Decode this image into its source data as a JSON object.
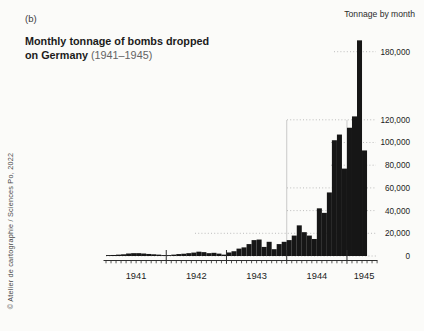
{
  "figure": {
    "panel_label": "(b)",
    "title_bold": "Monthly tonnage of bombs dropped",
    "title_line2_bold": "on Germany",
    "title_line2_regular": "(1941–1945)",
    "axis_title": "Tonnage by month",
    "credit": "© Atelier de cartographie / Sciences Po, 2022"
  },
  "colors": {
    "background": "#fbfbf9",
    "bar": "#161616",
    "axis": "#2e2e2e",
    "grid": "#b5b5b5",
    "separator_light": "#bdbdbd",
    "text": "#1c1c1c",
    "muted": "#636363"
  },
  "chart_data": {
    "type": "bar",
    "title": "Monthly tonnage of bombs dropped on Germany (1941–1945)",
    "xlabel": "",
    "ylabel": "Tonnage by month",
    "unit": "tons of bombs per month",
    "ylim": [
      0,
      190000
    ],
    "grid": "dotted horizontal",
    "legend_position": "none",
    "yticks": [
      0,
      20000,
      40000,
      60000,
      80000,
      100000,
      120000,
      180000
    ],
    "ytick_labels": [
      "0",
      "20,000",
      "40,000",
      "60,000",
      "80,000",
      "100,000",
      "120,000",
      "180,000"
    ],
    "year_labels": [
      "1941",
      "1942",
      "1943",
      "1944",
      "1945"
    ],
    "series": [
      {
        "year": "1941",
        "values": [
          800,
          900,
          1200,
          1500,
          2200,
          2500,
          2500,
          2200,
          1800,
          1500,
          1200,
          800
        ]
      },
      {
        "year": "1942",
        "values": [
          800,
          1200,
          1700,
          2000,
          2500,
          3000,
          3800,
          3400,
          2500,
          2800,
          2100,
          1200
        ]
      },
      {
        "year": "1943",
        "values": [
          3100,
          4200,
          6500,
          7600,
          10500,
          14000,
          14500,
          8000,
          12500,
          6000,
          10500,
          12500
        ]
      },
      {
        "year": "1944",
        "values": [
          14000,
          18000,
          27000,
          21000,
          18000,
          15000,
          42000,
          38000,
          56000,
          102000,
          107000,
          77000
        ]
      },
      {
        "year": "1945",
        "values": [
          113000,
          123000,
          190000,
          93000
        ]
      }
    ]
  }
}
